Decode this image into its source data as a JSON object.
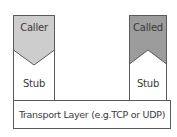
{
  "diagram": {
    "caller": {
      "label": "Caller",
      "fill": "#cdcdcd",
      "stub_label": "Stub"
    },
    "called": {
      "label": "Called",
      "fill": "#9c9c9c",
      "stub_label": "Stub"
    },
    "transport": {
      "label": "Transport Layer (e.g.TCP or UDP)"
    },
    "colors": {
      "stroke": "#5a5a5a",
      "background": "#ffffff",
      "text": "#3a3a3a"
    }
  }
}
